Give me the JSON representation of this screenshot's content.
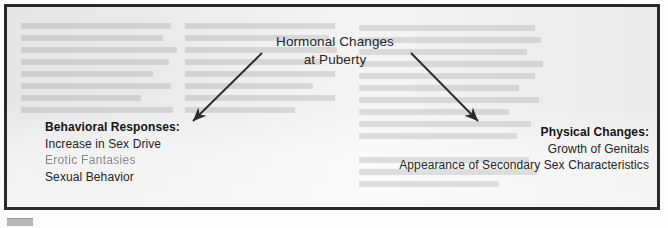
{
  "figure": {
    "title_line_1": "Hormonal Changes",
    "title_line_2": "at Puberty",
    "left_branch": {
      "header": "Behavioral Responses:",
      "items": [
        "Increase in Sex Drive",
        "Erotic Fantasies",
        "Sexual Behavior"
      ]
    },
    "right_branch": {
      "header": "Physical Changes:",
      "items": [
        "Growth of Genitals",
        "Appearance of Secondary Sex Characteristics"
      ]
    },
    "arrows": [
      {
        "name": "arrow-to-behavioral-responses",
        "direction": "down-left"
      },
      {
        "name": "arrow-to-physical-changes",
        "direction": "down-right"
      }
    ],
    "colors": {
      "border": "#2a2a2a",
      "paper": "#ececed",
      "text": "#242424",
      "arrow": "#2b2b2b",
      "faded_text": "#6e6a66"
    }
  }
}
